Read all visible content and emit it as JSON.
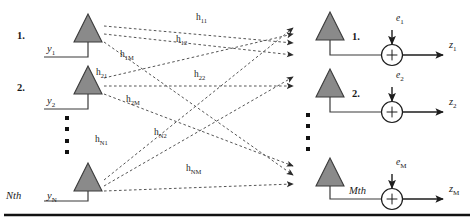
{
  "figure": {
    "background": "#ffffff",
    "antenna_fill": "#8a8a8a",
    "antenna_stroke": "#3b3b3b",
    "line_color": "#3b3b3b",
    "dash_color": "#555555",
    "rule_color": "#111111"
  },
  "transmit": {
    "label_kind": "input-branch",
    "items": [
      {
        "index": "1.",
        "signal": "y",
        "sub": "1"
      },
      {
        "index": "2.",
        "signal": "y",
        "sub": "2"
      },
      {
        "index": "Nth",
        "signal": "y",
        "sub": "N"
      }
    ],
    "ellipsis": "vertical-dots"
  },
  "receive": {
    "items": [
      {
        "index": "1.",
        "noise": "e",
        "noise_sub": "1",
        "output": "z",
        "output_sub": "1",
        "adder": "+"
      },
      {
        "index": "2.",
        "noise": "e",
        "noise_sub": "2",
        "output": "z",
        "output_sub": "2",
        "adder": "+"
      },
      {
        "index": "Mth",
        "noise": "e",
        "noise_sub": "M",
        "output": "z",
        "output_sub": "M",
        "adder": "+"
      }
    ],
    "ellipsis": "vertical-dots"
  },
  "channels": [
    {
      "symbol": "h",
      "sub": "11",
      "from": 1,
      "to": 1
    },
    {
      "symbol": "h",
      "sub": "12",
      "from": 1,
      "to": 2
    },
    {
      "symbol": "h",
      "sub": "1M",
      "from": 1,
      "to": "M"
    },
    {
      "symbol": "h",
      "sub": "21",
      "from": 2,
      "to": 1
    },
    {
      "symbol": "h",
      "sub": "22",
      "from": 2,
      "to": 2
    },
    {
      "symbol": "h",
      "sub": "2M",
      "from": 2,
      "to": "M"
    },
    {
      "symbol": "h",
      "sub": "N1",
      "from": "N",
      "to": 1
    },
    {
      "symbol": "h",
      "sub": "N2",
      "from": "N",
      "to": 2
    },
    {
      "symbol": "h",
      "sub": "NM",
      "from": "N",
      "to": "M"
    }
  ]
}
